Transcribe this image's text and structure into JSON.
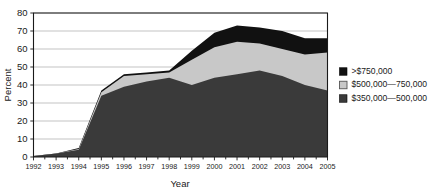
{
  "chart_data": {
    "type": "area",
    "stacked": true,
    "title": "",
    "xlabel": "Year",
    "ylabel": "Percent",
    "categories": [
      1992,
      1993,
      1994,
      1995,
      1996,
      1997,
      1998,
      1999,
      2000,
      2001,
      2002,
      2003,
      2004,
      2005
    ],
    "x_tick_labels": [
      "1992",
      "1993",
      "1994",
      "1995",
      "1996",
      "1997",
      "1998",
      "1999",
      "2000",
      "2001",
      "2002",
      "2003",
      "2004",
      "2005"
    ],
    "y_tick_labels": [
      "0",
      "10",
      "20",
      "30",
      "40",
      "50",
      "60",
      "70",
      "80"
    ],
    "y_ticks": [
      0,
      10,
      20,
      30,
      40,
      50,
      60,
      70,
      80
    ],
    "ylim": [
      0,
      80
    ],
    "xlim": [
      1992,
      2005
    ],
    "grid": "horizontal",
    "legend_position": "right",
    "series": [
      {
        "name": ">$750,000",
        "color": "#111111",
        "swatch": "filled-black",
        "values": [
          0.0,
          0.0,
          0.5,
          1.0,
          1.0,
          1.0,
          1.0,
          5.0,
          8.0,
          9.0,
          9.0,
          10.0,
          9.0,
          8.0
        ]
      },
      {
        "name": "$500,000—750,000",
        "color": "#c8c8c8",
        "swatch": "open-light",
        "values": [
          0.0,
          0.0,
          0.5,
          2.0,
          6.0,
          4.0,
          3.0,
          14.0,
          17.0,
          18.0,
          15.0,
          15.0,
          17.0,
          21.0
        ]
      },
      {
        "name": "$350,000—500,000",
        "color": "#3a3a3a",
        "swatch": "filled-dark",
        "values": [
          0.5,
          2.0,
          4.0,
          34.0,
          39.0,
          42.0,
          44.0,
          40.0,
          44.0,
          46.0,
          48.0,
          45.0,
          40.0,
          37.0
        ]
      }
    ],
    "cumulative_tops": {
      "band_350_500": [
        0.5,
        2.0,
        4.0,
        34.0,
        39.0,
        42.0,
        44.0,
        40.0,
        44.0,
        46.0,
        48.0,
        45.0,
        40.0,
        37.0
      ],
      "band_500_750": [
        0.5,
        2.0,
        4.5,
        36.0,
        45.0,
        46.0,
        47.0,
        54.0,
        61.0,
        64.0,
        63.0,
        60.0,
        57.0,
        58.0
      ],
      "band_over_750": [
        0.5,
        2.0,
        5.0,
        37.0,
        46.0,
        47.0,
        48.0,
        59.0,
        69.0,
        73.0,
        72.0,
        70.0,
        66.0,
        66.0
      ]
    }
  },
  "legend": {
    "items": [
      {
        "label": ">$750,000"
      },
      {
        "label": "$500,000—750,000"
      },
      {
        "label": "$350,000—500,000"
      }
    ]
  },
  "axes": {
    "x_title": "Year",
    "y_title": "Percent"
  },
  "colors": {
    "over_750": "#111111",
    "mid_500_750": "#c8c8c8",
    "low_350_500": "#3a3a3a",
    "grid": "#b4b4b4",
    "axis": "#1a1a1a",
    "background": "#ffffff"
  }
}
